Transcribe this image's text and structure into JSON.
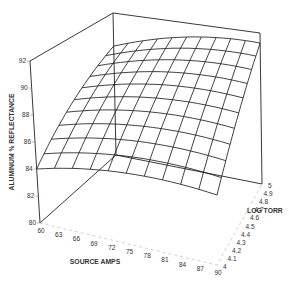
{
  "chart_data": {
    "type": "surface3d",
    "title": "",
    "xlabel": "SOURCE AMPS",
    "ylabel": "LOG TORR",
    "zlabel": "ALUMINUM % REFLECTANCE",
    "x_ticks": [
      "60",
      "63",
      "66",
      "69",
      "72",
      "75",
      "78",
      "81",
      "84",
      "87",
      "90"
    ],
    "y_ticks": [
      "4",
      "4.1",
      "4.2",
      "4.3",
      "4.4",
      "4.5",
      "4.6",
      "4.7",
      "4.8",
      "4.9",
      "5"
    ],
    "z_ticks": [
      "80",
      "82",
      "84",
      "86",
      "88",
      "90",
      "92"
    ],
    "xlim": [
      60,
      90
    ],
    "ylim": [
      4,
      5
    ],
    "zlim": [
      80,
      92
    ],
    "grid_x": [
      60,
      63,
      66,
      69,
      72,
      75,
      78,
      81,
      84,
      87,
      90
    ],
    "grid_y": [
      4,
      4.1,
      4.2,
      4.3,
      4.4,
      4.5,
      4.6,
      4.7,
      4.8,
      4.9,
      5
    ],
    "z_values_note": "Estimated response surface: ~84 at (60 amps, 4 log torr), rising to ~91.5 near (81 amps, 5 log torr), ~86.5 at (90 amps, 4 log torr)",
    "z_corner_estimates": {
      "60_4": 84.0,
      "90_4": 86.5,
      "60_5": 89.5,
      "90_5": 91.3
    },
    "legend": [],
    "grid": false
  }
}
